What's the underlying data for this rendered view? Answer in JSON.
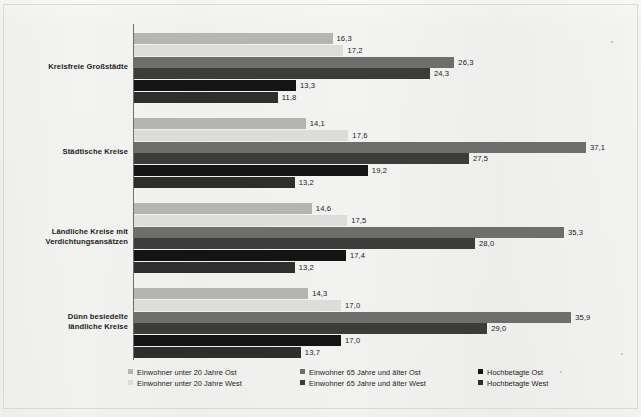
{
  "chart_data": {
    "type": "bar",
    "orientation": "horizontal",
    "title": "",
    "subtitle": "",
    "xlabel": "",
    "ylabel": "",
    "grid": false,
    "legend_position": "bottom",
    "xlim": [
      0,
      41
    ],
    "decimal_separator": ",",
    "categories": [
      "Kreisfreie Großstädte",
      "Städtische Kreise",
      "Ländliche Kreise mit Verdichtungsansätzen",
      "Dünn besiedelte ländliche Kreise"
    ],
    "category_lines": [
      [
        "Kreisfreie Großstädte"
      ],
      [
        "Städtische Kreise"
      ],
      [
        "Ländliche Kreise mit",
        "Verdichtungsansätzen"
      ],
      [
        "Dünn besiedelte",
        "ländliche Kreise"
      ]
    ],
    "series": [
      {
        "name": "Einwohner unter 20 Jahre Ost",
        "color": "#b4b4b2",
        "values": [
          16.3,
          14.1,
          14.6,
          14.3
        ],
        "labels": [
          "16,3",
          "14,1",
          "14,6",
          "14,3"
        ]
      },
      {
        "name": "Einwohner unter 20 Jahre West",
        "color": "#dcdcda",
        "values": [
          17.2,
          17.6,
          17.5,
          17.0
        ],
        "labels": [
          "17,2",
          "17,6",
          "17,5",
          "17,0"
        ]
      },
      {
        "name": "Einwohner 65 Jahre und älter Ost",
        "color": "#6e6e6c",
        "values": [
          26.3,
          37.1,
          35.3,
          35.9
        ],
        "labels": [
          "26,3",
          "37,1",
          "35,3",
          "35,9"
        ]
      },
      {
        "name": "Einwohner 65 Jahre und älter West",
        "color": "#3c3c3b",
        "values": [
          24.3,
          27.5,
          28.0,
          29.0
        ],
        "labels": [
          "24,3",
          "27,5",
          "28,0",
          "29,0"
        ]
      },
      {
        "name": "Hochbetagte Ost",
        "color": "#141414",
        "values": [
          13.3,
          19.2,
          17.4,
          17.0
        ],
        "labels": [
          "13,3",
          "19,2",
          "17,4",
          "17,0"
        ]
      },
      {
        "name": "Hochbetagte West",
        "color": "#2e2e2d",
        "values": [
          11.8,
          13.2,
          13.2,
          13.7
        ],
        "labels": [
          "11,8",
          "13,2",
          "13,2",
          "13,7"
        ]
      }
    ]
  },
  "legend": {
    "items": [
      {
        "label": "Einwohner unter 20 Jahre Ost",
        "color": "#b4b4b2"
      },
      {
        "label": "Einwohner unter 20 Jahre West",
        "color": "#dcdcda"
      },
      {
        "label": "Einwohner 65 Jahre und älter Ost",
        "color": "#6e6e6c"
      },
      {
        "label": "Einwohner 65 Jahre und älter West",
        "color": "#3c3c3b"
      },
      {
        "label": "Hochbetagte Ost",
        "color": "#141414"
      },
      {
        "label": "Hochbetagte West",
        "color": "#2e2e2d"
      }
    ]
  }
}
